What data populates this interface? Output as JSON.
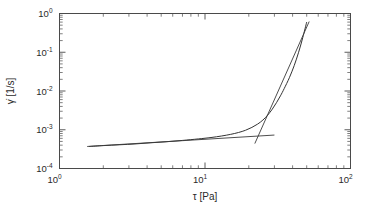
{
  "figure": {
    "background_color": "#ffffff",
    "axis_color": "#4a4a4a",
    "curve_color": "#333333",
    "width": 378,
    "height": 212
  },
  "axes": {
    "x": {
      "label": "τ [Pa]",
      "label_symbol": "τ",
      "label_units": "[Pa]",
      "scale": "log",
      "min": 1,
      "max": 100,
      "ticks": [
        {
          "value": 1,
          "mantissa": "10",
          "exponent": "0"
        },
        {
          "value": 10,
          "mantissa": "10",
          "exponent": "1"
        },
        {
          "value": 100,
          "mantissa": "10",
          "exponent": "2"
        }
      ]
    },
    "y": {
      "label": "γ̇ [1/s]",
      "label_symbol": "γ̇",
      "label_units": "[1/s]",
      "scale": "log",
      "min": 0.0001,
      "max": 1,
      "ticks": [
        {
          "value": 1,
          "mantissa": "10",
          "exponent": "0"
        },
        {
          "value": 0.1,
          "mantissa": "10",
          "exponent": "-1"
        },
        {
          "value": 0.01,
          "mantissa": "10",
          "exponent": "-2"
        },
        {
          "value": 0.001,
          "mantissa": "10",
          "exponent": "-3"
        },
        {
          "value": 0.0001,
          "mantissa": "10",
          "exponent": "-4"
        }
      ]
    }
  },
  "chart_data": {
    "type": "line",
    "title": "",
    "xlabel": "τ [Pa]",
    "ylabel": "γ̇ [1/s]",
    "xscale": "log",
    "yscale": "log",
    "xlim": [
      1,
      100
    ],
    "ylim": [
      0.0001,
      1
    ],
    "grid": false,
    "legend": null,
    "series": [
      {
        "name": "flow curve",
        "style": "solid",
        "x": [
          1.6,
          2.0,
          2.6,
          3.3,
          4.2,
          5.4,
          7.0,
          9.0,
          11.0,
          13.0,
          15.0,
          17.0,
          19.0,
          21.0,
          23.0,
          25.0,
          27.0,
          29.0,
          31.0,
          33.0,
          35.0,
          38.0,
          41.0,
          44.0,
          47.0,
          50.0
        ],
        "y": [
          0.00037,
          0.00039,
          0.00041,
          0.00043,
          0.00046,
          0.00049,
          0.00053,
          0.00058,
          0.00063,
          0.00069,
          0.00076,
          0.00085,
          0.00097,
          0.00115,
          0.0014,
          0.00178,
          0.0024,
          0.0034,
          0.005,
          0.0075,
          0.0115,
          0.022,
          0.045,
          0.1,
          0.24,
          0.6
        ]
      },
      {
        "name": "low-shear tangent",
        "style": "solid-straight",
        "x": [
          1.55,
          30.0
        ],
        "y": [
          0.00037,
          0.00073
        ]
      },
      {
        "name": "high-shear tangent",
        "style": "solid-straight",
        "x": [
          22.0,
          52.0
        ],
        "y": [
          0.00044,
          0.62
        ]
      }
    ],
    "annotations": []
  }
}
